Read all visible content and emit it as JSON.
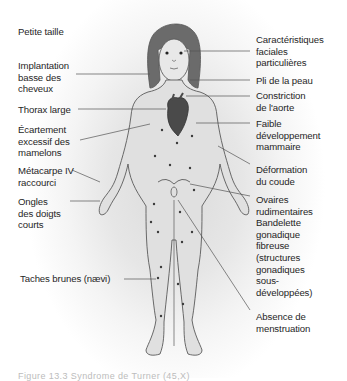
{
  "diagram": {
    "subject": "Syndrome de Turner",
    "colors": {
      "outline": "#5a5a5a",
      "hair": "#6b6b6b",
      "heart": "#4a4a4a",
      "naevi": "#3a3a3a",
      "leader_line": "#555555",
      "text": "#1f1f1f"
    },
    "labels_left": [
      {
        "id": "short-stature",
        "lines": [
          "Petite taille"
        ]
      },
      {
        "id": "low-hairline",
        "lines": [
          "Implantation",
          "basse des",
          "cheveux"
        ]
      },
      {
        "id": "broad-chest",
        "lines": [
          "Thorax large"
        ]
      },
      {
        "id": "widely-spaced-nipples",
        "lines": [
          "Écartement",
          "excessif des",
          "mamelons"
        ]
      },
      {
        "id": "short-fourth-metacarpal",
        "lines": [
          "Métacarpe IV",
          "raccourci"
        ]
      },
      {
        "id": "short-nails",
        "lines": [
          "Ongles",
          "des doigts",
          "courts"
        ]
      },
      {
        "id": "brown-spots",
        "lines": [
          "Taches brunes (nævi)"
        ]
      }
    ],
    "labels_right": [
      {
        "id": "facial-features",
        "lines": [
          "Caractéristiques",
          "faciales",
          "particulières"
        ]
      },
      {
        "id": "skin-fold",
        "lines": [
          "Pli de la peau"
        ]
      },
      {
        "id": "aortic-constriction",
        "lines": [
          "Constriction",
          "de l'aorte"
        ]
      },
      {
        "id": "breast-development",
        "lines": [
          "Faible",
          "développement",
          "mammaire"
        ]
      },
      {
        "id": "elbow-deformity",
        "lines": [
          "Déformation",
          "du coude"
        ]
      },
      {
        "id": "rudimentary-ovaries",
        "lines": [
          "Ovaires",
          "rudimentaires",
          "Bandelette",
          "gonadique",
          "fibreuse",
          "(structures",
          "gonadiques",
          "sous-",
          "développées)"
        ]
      },
      {
        "id": "amenorrhea",
        "lines": [
          "Absence de",
          "menstruation"
        ]
      }
    ],
    "caption": "Figure 13.3 Syndrome de Turner (45,X)"
  }
}
